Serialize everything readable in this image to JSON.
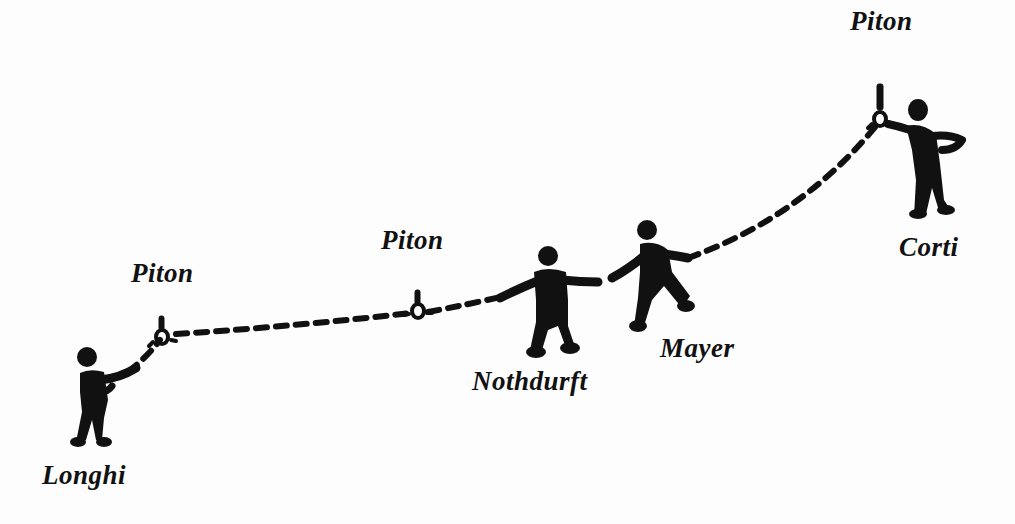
{
  "diagram": {
    "title": "",
    "colors": {
      "ink": "#111111",
      "background": "#fdfdfd"
    },
    "pitons": [
      {
        "id": "piton-1",
        "label": "Piton",
        "x": 163,
        "y": 338
      },
      {
        "id": "piton-2",
        "label": "Piton",
        "x": 418,
        "y": 313
      },
      {
        "id": "piton-3",
        "label": "Piton",
        "x": 880,
        "y": 120
      }
    ],
    "climbers": [
      {
        "id": "longhi",
        "label": "Longhi"
      },
      {
        "id": "nothdurft",
        "label": "Nothdurft"
      },
      {
        "id": "mayer",
        "label": "Mayer"
      },
      {
        "id": "corti",
        "label": "Corti"
      }
    ],
    "rope": {
      "style": "dashed",
      "order": [
        "Longhi",
        "Piton",
        "Piton",
        "Nothdurft",
        "Mayer",
        "Piton",
        "Corti"
      ]
    }
  }
}
